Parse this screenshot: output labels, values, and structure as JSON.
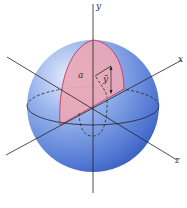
{
  "diagram": {
    "type": "sphere-quarter-disk-centroid",
    "axes": {
      "x": "x",
      "y": "y",
      "z": "z"
    },
    "labels": {
      "radius": "a",
      "centroid": "ȳ"
    },
    "colors": {
      "sphere_light": "#dfe8fb",
      "sphere_mid": "#6f93e0",
      "sphere_dark": "#2f56b8",
      "region_fill": "#e8a3b3",
      "region_stroke": "#c23a5a",
      "axis": "#222222",
      "dashed": "#2f4f3f"
    }
  }
}
